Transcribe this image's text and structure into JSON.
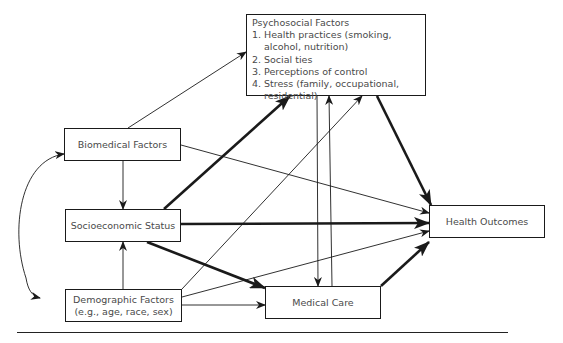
{
  "diagram": {
    "nodes": {
      "psychosocial": {
        "title": "Psychosocial Factors",
        "items": [
          {
            "num": "1.",
            "text": "Health practices (smoking, alcohol, nutrition)"
          },
          {
            "num": "2.",
            "text": "Social ties"
          },
          {
            "num": "3.",
            "text": "Perceptions of control"
          },
          {
            "num": "4.",
            "text": "Stress (family, occupational, residential)"
          }
        ]
      },
      "biomedical": {
        "label": "Biomedical Factors"
      },
      "socioeconomic": {
        "label": "Socioeconomic Status"
      },
      "demographic": {
        "line1": "Demographic Factors",
        "line2": "(e.g., age, race, sex)"
      },
      "medical_care": {
        "label": "Medical Care"
      },
      "health_outcomes": {
        "label": "Health Outcomes"
      }
    },
    "edges": [
      {
        "from": "biomedical",
        "to": "psychosocial",
        "weight": "thin"
      },
      {
        "from": "biomedical",
        "to": "socioeconomic",
        "weight": "thin"
      },
      {
        "from": "biomedical",
        "to": "health_outcomes",
        "weight": "thin"
      },
      {
        "from": "demographic",
        "to": "biomedical",
        "weight": "thin",
        "curved": true
      },
      {
        "from": "biomedical",
        "to": "demographic",
        "weight": "thin",
        "curved": true
      },
      {
        "from": "socioeconomic",
        "to": "psychosocial",
        "weight": "thick"
      },
      {
        "from": "socioeconomic",
        "to": "health_outcomes",
        "weight": "thick"
      },
      {
        "from": "socioeconomic",
        "to": "medical_care",
        "weight": "thick"
      },
      {
        "from": "demographic",
        "to": "socioeconomic",
        "weight": "thin"
      },
      {
        "from": "demographic",
        "to": "psychosocial",
        "weight": "thin"
      },
      {
        "from": "demographic",
        "to": "health_outcomes",
        "weight": "thin"
      },
      {
        "from": "demographic",
        "to": "medical_care",
        "weight": "thin"
      },
      {
        "from": "psychosocial",
        "to": "medical_care",
        "weight": "thin"
      },
      {
        "from": "medical_care",
        "to": "psychosocial",
        "weight": "thin"
      },
      {
        "from": "psychosocial",
        "to": "health_outcomes",
        "weight": "thick"
      },
      {
        "from": "medical_care",
        "to": "health_outcomes",
        "weight": "thick"
      }
    ]
  }
}
